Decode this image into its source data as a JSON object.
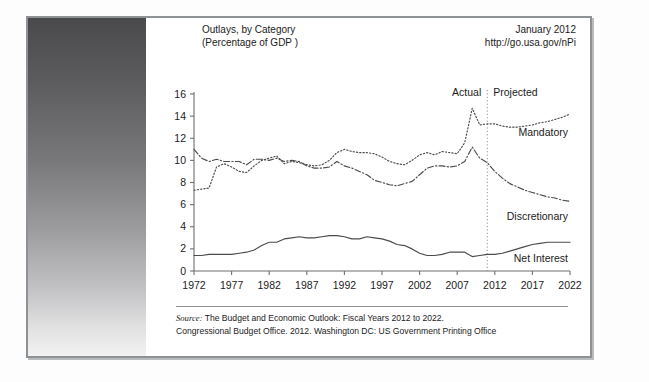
{
  "exhibit": {
    "label": "EXHIBIT 4.3",
    "title": "Major Components of Federal Spending, 1972–2022"
  },
  "chart_header": {
    "title_line1": "Outlays, by Category",
    "title_line2": "(Percentage of GDP )",
    "date": "January 2012",
    "url": "http://go.usa.gov/nPi"
  },
  "source": {
    "prefix": "Source:",
    "line1": " The Budget and Economic Outlook: Fiscal Years 2012 to 2022.",
    "line2": "Congressional Budget Office. 2012. Washington DC: US Government Printing Office"
  },
  "annotations": {
    "actual": "Actual",
    "projected": "Projected",
    "mandatory": "Mandatory",
    "discretionary": "Discretionary",
    "net_interest": "Net Interest"
  },
  "colors": {
    "line": "#4b4b4d",
    "axis": "#6d6f71",
    "frame": "#8f9295",
    "text": "#1b1b1b"
  },
  "chart_data": {
    "type": "line",
    "title": "Outlays, by Category (Percentage of GDP )",
    "xlabel": "",
    "ylabel": "",
    "xlim": [
      1972,
      2022
    ],
    "ylim": [
      0,
      16
    ],
    "yticks": [
      0,
      2,
      4,
      6,
      8,
      10,
      12,
      14,
      16
    ],
    "xticks": [
      1972,
      1977,
      1982,
      1987,
      1992,
      1997,
      2002,
      2007,
      2012,
      2017,
      2022
    ],
    "grid": false,
    "legend": "inline-labels",
    "divider_year": 2011,
    "divider_labels": [
      "Actual",
      "Projected"
    ],
    "x": [
      1972,
      1973,
      1974,
      1975,
      1976,
      1977,
      1978,
      1979,
      1980,
      1981,
      1982,
      1983,
      1984,
      1985,
      1986,
      1987,
      1988,
      1989,
      1990,
      1991,
      1992,
      1993,
      1994,
      1995,
      1996,
      1997,
      1998,
      1999,
      2000,
      2001,
      2002,
      2003,
      2004,
      2005,
      2006,
      2007,
      2008,
      2009,
      2010,
      2011,
      2012,
      2013,
      2014,
      2015,
      2016,
      2017,
      2018,
      2019,
      2020,
      2021,
      2022
    ],
    "series": [
      {
        "name": "Discretionary",
        "style": "dash-dot",
        "values": [
          11.0,
          10.2,
          9.9,
          10.1,
          9.9,
          9.9,
          9.9,
          9.6,
          10.1,
          10.1,
          10.0,
          10.2,
          9.9,
          10.0,
          9.9,
          9.5,
          9.3,
          9.3,
          9.4,
          9.9,
          9.5,
          9.3,
          9.0,
          8.7,
          8.2,
          8.0,
          7.8,
          7.7,
          7.9,
          8.1,
          8.7,
          9.3,
          9.5,
          9.5,
          9.4,
          9.5,
          9.9,
          11.2,
          10.2,
          9.8,
          9.0,
          8.4,
          7.9,
          7.6,
          7.3,
          7.1,
          6.9,
          6.7,
          6.6,
          6.4,
          6.3
        ]
      },
      {
        "name": "Mandatory",
        "style": "dotted",
        "values": [
          7.3,
          7.4,
          7.5,
          9.4,
          9.7,
          9.4,
          9.0,
          8.9,
          9.5,
          10.0,
          10.2,
          10.4,
          9.7,
          9.9,
          9.8,
          9.6,
          9.5,
          9.6,
          10.0,
          10.7,
          11.0,
          10.8,
          10.7,
          10.7,
          10.6,
          10.3,
          9.9,
          9.7,
          9.6,
          10.0,
          10.5,
          10.7,
          10.5,
          10.8,
          10.7,
          10.6,
          11.6,
          14.7,
          13.2,
          13.3,
          13.3,
          13.1,
          13.0,
          13.0,
          13.1,
          13.2,
          13.4,
          13.5,
          13.7,
          13.9,
          14.2
        ]
      },
      {
        "name": "Net Interest",
        "style": "solid",
        "values": [
          1.4,
          1.4,
          1.5,
          1.5,
          1.5,
          1.5,
          1.6,
          1.7,
          1.9,
          2.3,
          2.6,
          2.6,
          2.9,
          3.0,
          3.1,
          3.0,
          3.0,
          3.1,
          3.2,
          3.2,
          3.1,
          2.9,
          2.9,
          3.1,
          3.0,
          2.9,
          2.7,
          2.4,
          2.3,
          2.0,
          1.6,
          1.4,
          1.4,
          1.5,
          1.7,
          1.7,
          1.7,
          1.3,
          1.4,
          1.5,
          1.5,
          1.6,
          1.8,
          2.0,
          2.2,
          2.4,
          2.5,
          2.6,
          2.6,
          2.6,
          2.6
        ]
      }
    ]
  }
}
